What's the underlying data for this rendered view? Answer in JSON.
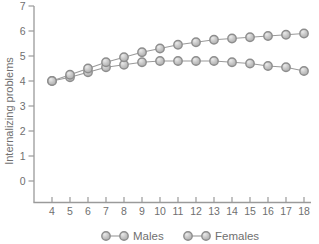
{
  "chart_data": {
    "type": "line",
    "title": "",
    "xlabel": "",
    "ylabel": "Internalizing problems",
    "x": [
      4,
      5,
      6,
      7,
      8,
      9,
      10,
      11,
      12,
      13,
      14,
      15,
      16,
      17,
      18
    ],
    "series": [
      {
        "name": "Males",
        "values": [
          4.0,
          4.15,
          4.35,
          4.55,
          4.65,
          4.75,
          4.8,
          4.8,
          4.8,
          4.8,
          4.75,
          4.7,
          4.6,
          4.55,
          4.4
        ]
      },
      {
        "name": "Females",
        "values": [
          4.0,
          4.25,
          4.5,
          4.75,
          4.95,
          5.15,
          5.3,
          5.45,
          5.55,
          5.65,
          5.7,
          5.75,
          5.8,
          5.85,
          5.9
        ]
      }
    ],
    "xlim": [
      4,
      18
    ],
    "ylim": [
      0,
      7
    ],
    "yticks": [
      0,
      1,
      2,
      3,
      4,
      5,
      6,
      7
    ],
    "xticks": [
      4,
      5,
      6,
      7,
      8,
      9,
      10,
      11,
      12,
      13,
      14,
      15,
      16,
      17,
      18
    ],
    "grid": false,
    "legend_position": "bottom",
    "legend": [
      "Males",
      "Females"
    ],
    "style": {
      "marker": "circle",
      "marker_fill": "#c6c6c6",
      "marker_highlight": "#e9e9e9",
      "marker_stroke": "#8d8d8d",
      "line_color": "#9a9a9a",
      "axis_color": "#9a9a9a",
      "text_color": "#6f6f6f",
      "background": "#ffffff"
    }
  }
}
